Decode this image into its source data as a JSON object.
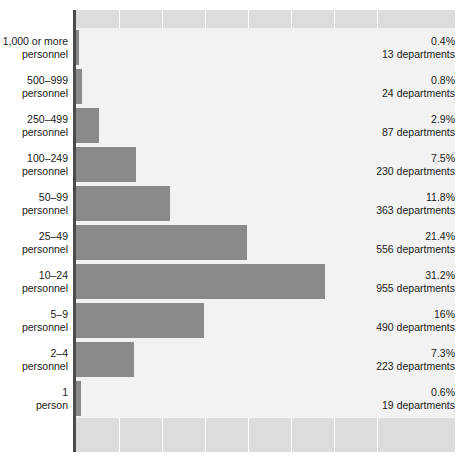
{
  "chart_data": {
    "type": "bar",
    "orientation": "horizontal",
    "title": "",
    "subtitle": "",
    "xlabel": "",
    "ylabel": "",
    "grid": true,
    "legend": "none",
    "xlim": [
      0,
      47.5
    ],
    "value_suffix": "%",
    "count_suffix": "departments",
    "categories": [
      "1,000 or more\npersonnel",
      "500–999\npersonnel",
      "250–499\npersonnel",
      "100–249\npersonnel",
      "50–99\npersonnel",
      "25–49\npersonnel",
      "10–24\npersonnel",
      "5–9\npersonnel",
      "2–4\npersonnel",
      "1\nperson"
    ],
    "values": [
      0.4,
      0.8,
      2.9,
      7.5,
      11.8,
      21.4,
      31.2,
      16,
      7.3,
      0.6
    ],
    "counts": [
      13,
      24,
      87,
      230,
      363,
      556,
      955,
      490,
      223,
      19
    ],
    "rows": [
      {
        "label_line1": "1,000 or more",
        "label_line2": "personnel",
        "percent_text": "0.4%",
        "count_text": "13 departments",
        "value": 0.4
      },
      {
        "label_line1": "500–999",
        "label_line2": "personnel",
        "percent_text": "0.8%",
        "count_text": "24 departments",
        "value": 0.8
      },
      {
        "label_line1": "250–499",
        "label_line2": "personnel",
        "percent_text": "2.9%",
        "count_text": "87 departments",
        "value": 2.9
      },
      {
        "label_line1": "100–249",
        "label_line2": "personnel",
        "percent_text": "7.5%",
        "count_text": "230 departments",
        "value": 7.5
      },
      {
        "label_line1": "50–99",
        "label_line2": "personnel",
        "percent_text": "11.8%",
        "count_text": "363 departments",
        "value": 11.8
      },
      {
        "label_line1": "25–49",
        "label_line2": "personnel",
        "percent_text": "21.4%",
        "count_text": "556 departments",
        "value": 21.4
      },
      {
        "label_line1": "10–24",
        "label_line2": "personnel",
        "percent_text": "31.2%",
        "count_text": "955 departments",
        "value": 31.2
      },
      {
        "label_line1": "5–9",
        "label_line2": "personnel",
        "percent_text": "16%",
        "count_text": "490 departments",
        "value": 16
      },
      {
        "label_line1": "2–4",
        "label_line2": "personnel",
        "percent_text": "7.3%",
        "count_text": "223 departments",
        "value": 7.3
      },
      {
        "label_line1": "1",
        "label_line2": "person",
        "percent_text": "0.6%",
        "count_text": "19 departments",
        "value": 0.6
      }
    ],
    "gridline_step_percent": 5.39,
    "gridline_count": 7,
    "colors": {
      "bar": "#8a8a8a",
      "plot_background": "#dcdcdc",
      "row_band": "#f2f2f2",
      "gridline": "#ffffff",
      "axis": "#4a4a4a",
      "text": "#1a1a1a",
      "page_background": "#ffffff"
    },
    "geometry": {
      "plot_left_px": 76,
      "plot_top_px": 10,
      "plot_width_px": 379,
      "plot_height_px": 442,
      "row_height_px": 39,
      "first_row_top_px": 28,
      "px_per_percent": 7.98
    }
  }
}
